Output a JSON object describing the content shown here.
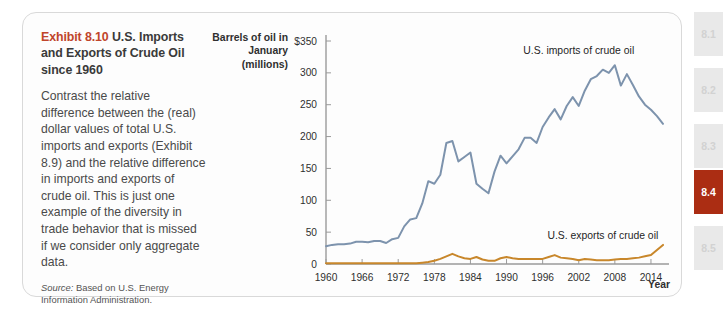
{
  "exhibit": {
    "number": "Exhibit 8.10",
    "title": "U.S. Imports and Exports of Crude Oil since 1960",
    "body": "Contrast the relative difference between the (real) dollar values of total U.S. imports and exports (Exhibit 8.9) and the relative difference in imports and exports of crude oil. This is just one example of the diversity in trade behavior that is missed if we consider only aggregate data.",
    "source_label": "Source:",
    "source_text": " Based on U.S. Energy Information Administration.",
    "accent_color": "#c0452b"
  },
  "chart_data": {
    "type": "line",
    "title": "U.S. Imports and Exports of Crude Oil since 1960",
    "ylabel": "Barrels of oil in January (millions)",
    "xlabel": "Year",
    "ylim": [
      0,
      350
    ],
    "xlim": [
      1960,
      2016
    ],
    "grid": false,
    "legend_position": "inline-annotation",
    "y_ticks": [
      "$350",
      "300",
      "250",
      "200",
      "150",
      "100",
      "50",
      "0"
    ],
    "y_tick_values": [
      350,
      300,
      250,
      200,
      150,
      100,
      50,
      0
    ],
    "x_ticks": [
      "1960",
      "1966",
      "1972",
      "1978",
      "1984",
      "1990",
      "1996",
      "2002",
      "2008",
      "2014"
    ],
    "x_tick_values": [
      1960,
      1966,
      1972,
      1978,
      1984,
      1990,
      1996,
      2002,
      2008,
      2014
    ],
    "x": [
      1960,
      1961,
      1962,
      1963,
      1964,
      1965,
      1966,
      1967,
      1968,
      1969,
      1970,
      1971,
      1972,
      1973,
      1974,
      1975,
      1976,
      1977,
      1978,
      1979,
      1980,
      1981,
      1982,
      1983,
      1984,
      1985,
      1986,
      1987,
      1988,
      1989,
      1990,
      1991,
      1992,
      1993,
      1994,
      1995,
      1996,
      1997,
      1998,
      1999,
      2000,
      2001,
      2002,
      2003,
      2004,
      2005,
      2006,
      2007,
      2008,
      2009,
      2010,
      2011,
      2012,
      2013,
      2014,
      2015,
      2016
    ],
    "series": [
      {
        "name": "U.S. imports of crude oil",
        "color": "#7d93ad",
        "values": [
          28,
          30,
          31,
          31,
          32,
          35,
          35,
          34,
          36,
          36,
          33,
          39,
          41,
          59,
          70,
          72,
          95,
          130,
          126,
          140,
          190,
          193,
          161,
          168,
          175,
          126,
          118,
          111,
          145,
          170,
          158,
          169,
          180,
          198,
          198,
          190,
          215,
          230,
          243,
          227,
          248,
          262,
          248,
          272,
          290,
          295,
          305,
          300,
          312,
          280,
          298,
          281,
          263,
          250,
          242,
          232,
          220
        ]
      },
      {
        "name": "U.S. exports of crude oil",
        "color": "#c8872b",
        "values": [
          1,
          1,
          1,
          1,
          1,
          1,
          1,
          1,
          1,
          1,
          1,
          1,
          1,
          1,
          1,
          1,
          2,
          3,
          5,
          8,
          12,
          16,
          12,
          9,
          8,
          11,
          7,
          5,
          5,
          9,
          11,
          9,
          8,
          8,
          8,
          8,
          8,
          11,
          14,
          10,
          9,
          8,
          6,
          8,
          7,
          6,
          6,
          6,
          7,
          8,
          8,
          9,
          10,
          12,
          14,
          22,
          30
        ]
      }
    ],
    "annotations": [
      {
        "text": "U.S. imports of crude oil",
        "x": 2002,
        "y": 330
      },
      {
        "text": "U.S. exports of crude oil",
        "x": 2006,
        "y": 40
      }
    ]
  },
  "tab_strip": {
    "active_color": "#ab2d13",
    "items": [
      {
        "label": "8.1",
        "active": false
      },
      {
        "label": "8.2",
        "active": false
      },
      {
        "label": "8.3",
        "active": false
      },
      {
        "label": "8.4",
        "active": true
      },
      {
        "label": "8.5",
        "active": false
      }
    ]
  }
}
